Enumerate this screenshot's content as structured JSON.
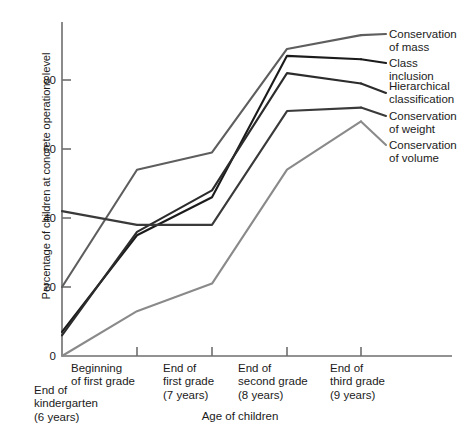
{
  "chart_data": {
    "type": "line",
    "title": "",
    "xlabel": "Age of children",
    "ylabel": "Percentage of children at concrete operations level",
    "categories": [
      "End of kindergarten (6 years)",
      "Beginning of first grade",
      "End of first grade (7 years)",
      "End of second grade (8 years)",
      "End of third grade (9 years)"
    ],
    "x_tick_labels": [
      "End of\nkindergarten\n(6 years)",
      "Beginning\nof first grade",
      "End of\nfirst grade\n(7 years)",
      "End of\nsecond grade\n(8 years)",
      "End of\nthird grade\n(9 years)"
    ],
    "y_tick_labels": [
      "0",
      "20",
      "40",
      "60",
      "80"
    ],
    "y_ticks": [
      0,
      20,
      40,
      60,
      80
    ],
    "ylim": [
      0,
      96
    ],
    "grid": false,
    "legend_position": "right-of-lines",
    "series": [
      {
        "name": "Conservation of mass",
        "label": "Conservation\nof mass",
        "color": "#5e5e5e",
        "values": [
          20,
          54,
          59,
          89,
          93
        ]
      },
      {
        "name": "Class inclusion",
        "label": "Class inclusion",
        "color": "#1b1b1b",
        "values": [
          7,
          35,
          46,
          87,
          86
        ]
      },
      {
        "name": "Hierarchical classification",
        "label": "Hierarchical\nclassification",
        "color": "#2c2c2c",
        "values": [
          6,
          36,
          48,
          82,
          79
        ]
      },
      {
        "name": "Conservation of weight",
        "label": "Conservation\nof weight",
        "color": "#3a3a3a",
        "values": [
          42,
          38,
          38,
          71,
          72
        ]
      },
      {
        "name": "Conservation of volume",
        "label": "Conservation\nof volume",
        "color": "#8a8a8a",
        "values": [
          0,
          13,
          21,
          54,
          68
        ]
      }
    ]
  },
  "axes": {
    "y_title": "Percentage of children at concrete operations level",
    "x_title": "Age of children"
  },
  "caption": {
    "text": ""
  },
  "colors": {
    "axis": "#6e6e6e",
    "text": "#1b1b1b"
  }
}
